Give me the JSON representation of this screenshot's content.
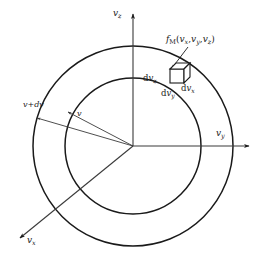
{
  "figure": {
    "name": "maxwell-velocity-distribution-diagram",
    "background_color": "#ffffff",
    "line_color": "#1a1a1a",
    "thin_line_color": "#4d4d4d"
  },
  "axes": [
    {
      "id": "vz",
      "label_main": "v",
      "label_sub": "z",
      "direction": "up",
      "label_x": 113,
      "label_y": 9
    },
    {
      "id": "vy",
      "label_main": "v",
      "label_sub": "y",
      "direction": "right",
      "label_x": 216,
      "label_y": 129
    },
    {
      "id": "vx",
      "label_main": "v",
      "label_sub": "x",
      "direction": "down-left",
      "label_x": 27,
      "label_y": 236
    }
  ],
  "circles": {
    "center_x": 133,
    "center_y": 146,
    "inner_radius": 68,
    "outer_radius": 100,
    "inner_label": "v",
    "outer_label": "v+dv"
  },
  "radius_labels": {
    "outer": {
      "text": "v+dv",
      "x": 23,
      "y": 101
    },
    "inner": {
      "text": "v",
      "x": 77,
      "y": 110
    }
  },
  "distribution_label": {
    "function_name": "f",
    "function_sub": "M",
    "open_paren": "(",
    "arg1_main": "v",
    "arg1_sub": "x",
    "comma1": ",",
    "arg2_main": "v",
    "arg2_sub": "y",
    "comma2": ",",
    "arg3_main": "v",
    "arg3_sub": "z",
    "close_paren": ")",
    "x": 166,
    "y": 35
  },
  "volume_element": {
    "name": "differential-volume-cube",
    "center_x": 181,
    "center_y": 75,
    "labels": [
      {
        "id": "dvz",
        "prefix": "d",
        "main": "v",
        "sub": "z",
        "x": 143,
        "y": 74
      },
      {
        "id": "dvy",
        "prefix": "d",
        "main": "v",
        "sub": "y",
        "x": 161,
        "y": 89
      },
      {
        "id": "dvx",
        "prefix": "d",
        "main": "v",
        "sub": "x",
        "x": 181,
        "y": 84
      }
    ]
  }
}
